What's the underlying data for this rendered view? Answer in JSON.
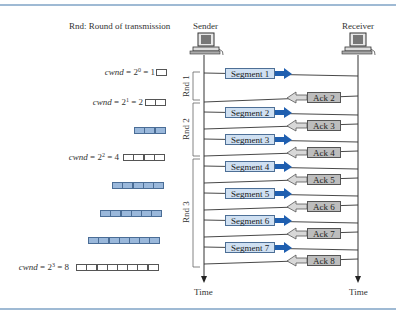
{
  "legend": "Rnd: Round of transmission",
  "hosts": {
    "sender": "Sender",
    "receiver": "Receiver",
    "time_left": "Time",
    "time_right": "Time"
  },
  "cwnd": [
    {
      "prefix": "cwnd",
      "exp": "0",
      "value": "1",
      "cells": 1
    },
    {
      "prefix": "cwnd",
      "exp": "1",
      "value": "2",
      "cells": 2
    },
    {
      "prefix": "cwnd",
      "exp": "2",
      "value": "4",
      "cells": 4
    },
    {
      "prefix": "cwnd",
      "exp": "3",
      "value": "8",
      "cells": 8
    }
  ],
  "filled_windows": [
    3,
    5,
    6,
    7
  ],
  "rounds": [
    "Rnd 1",
    "Rnd 2",
    "Rnd 3"
  ],
  "segments": [
    "Segment 1",
    "Segment 2",
    "Segment 3",
    "Segment 4",
    "Segment 5",
    "Segment 6",
    "Segment 7"
  ],
  "acks": [
    "Ack 2",
    "Ack 3",
    "Ack 4",
    "Ack 5",
    "Ack 6",
    "Ack 7",
    "Ack 8"
  ],
  "colors": {
    "segment_fill": "#cfe0f2",
    "segment_arrow": "#1f5fb0",
    "ack_fill": "#bdbdbd",
    "ack_arrow": "#d8d8d8",
    "window_fill": "#9ab8db",
    "rule": "#9fbad4"
  }
}
